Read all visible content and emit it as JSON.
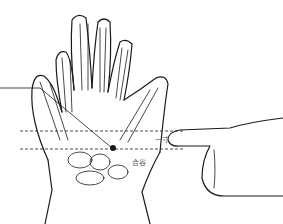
{
  "labels": {
    "cun": "一寸",
    "hegu": "合谷"
  },
  "colors": {
    "line": "#1a1a1a",
    "label": "#555555"
  }
}
